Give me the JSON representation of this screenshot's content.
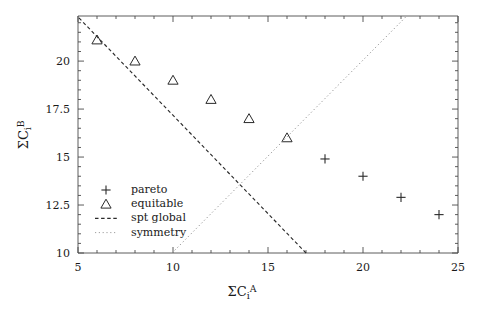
{
  "chart_data": {
    "type": "scatter",
    "title": "",
    "xlabel": "ΣCᵢᴬ",
    "ylabel": "ΣCᵢᴮ",
    "xlabel_parts": {
      "sigma": "Σ",
      "base": "C",
      "sub": "i",
      "sup": "A"
    },
    "ylabel_parts": {
      "sigma": "Σ",
      "base": "C",
      "sub": "i",
      "sup": "B"
    },
    "xlim": [
      5,
      25
    ],
    "ylim": [
      10,
      22.35
    ],
    "xticks": [
      5,
      10,
      15,
      20,
      25
    ],
    "xtick_labels": [
      "5",
      "10",
      "15",
      "20",
      "25"
    ],
    "yticks": [
      10,
      12.5,
      15,
      17.5,
      20
    ],
    "ytick_labels": [
      "10",
      "12.5",
      "15",
      "17.5",
      "20"
    ],
    "x_minor_step": 1,
    "y_minor_step": 0.5,
    "grid": false,
    "legend_position": "lower-left-inside",
    "series": [
      {
        "name": "pareto",
        "marker": "plus",
        "color": "#2a2a2a",
        "points": [
          {
            "x": 18,
            "y": 14.9
          },
          {
            "x": 20,
            "y": 14.0
          },
          {
            "x": 22,
            "y": 12.9
          },
          {
            "x": 24,
            "y": 12.0
          }
        ]
      },
      {
        "name": "equitable",
        "marker": "triangle",
        "color": "#2a2a2a",
        "points": [
          {
            "x": 6,
            "y": 21.1
          },
          {
            "x": 8,
            "y": 20.0
          },
          {
            "x": 10,
            "y": 19.0
          },
          {
            "x": 12,
            "y": 18.0
          },
          {
            "x": 14,
            "y": 17.0
          },
          {
            "x": 16,
            "y": 16.0
          }
        ]
      },
      {
        "name": "spt global",
        "marker": "dashed-line",
        "color": "#2a2a2a",
        "line": [
          {
            "x": 5.05,
            "y": 22.25
          },
          {
            "x": 17.0,
            "y": 10.0
          }
        ]
      },
      {
        "name": "symmetry",
        "marker": "dotted-line",
        "color": "#8a8a8a",
        "line": [
          {
            "x": 9.95,
            "y": 10.0
          },
          {
            "x": 22.3,
            "y": 22.35
          }
        ]
      }
    ]
  },
  "legend": {
    "entries": [
      {
        "label": "pareto",
        "key": "plus"
      },
      {
        "label": "equitable",
        "key": "triangle"
      },
      {
        "label": "spt global",
        "key": "dashed"
      },
      {
        "label": "symmetry",
        "key": "dotted"
      }
    ]
  },
  "colors": {
    "axis": "#4a4a4a",
    "marker": "#2a2a2a",
    "dashed": "#2a2a2a",
    "dotted": "#9a9a9a",
    "text": "#1a1a1a",
    "background": "#ffffff"
  }
}
